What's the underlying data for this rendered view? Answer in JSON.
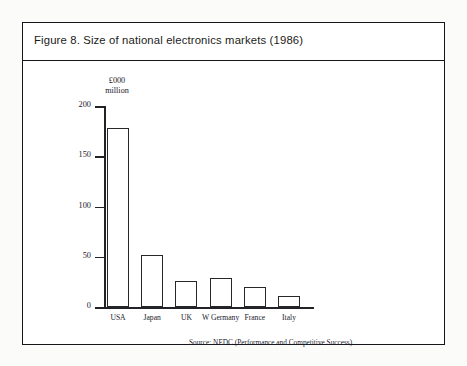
{
  "figure": {
    "title": "Figure 8. Size of national electronics markets (1986)"
  },
  "chart_data": {
    "type": "bar",
    "title": "Figure 8. Size of national electronics markets (1986)",
    "categories": [
      "USA",
      "Japan",
      "UK",
      "W Germany",
      "France",
      "Italy"
    ],
    "values": [
      178,
      52,
      26,
      29,
      20,
      11
    ],
    "xlabel": "",
    "ylabel": "£000 million",
    "ylim": [
      0,
      200
    ],
    "yticks": [
      0,
      50,
      100,
      150,
      200
    ],
    "ytick_labels": [
      "0",
      "50",
      "100",
      "150",
      "200"
    ],
    "grid": false,
    "legend": false,
    "unit_line1": "£000",
    "unit_line2": "million",
    "source": "Source: NEDC (Performance and Competitive Success)"
  }
}
